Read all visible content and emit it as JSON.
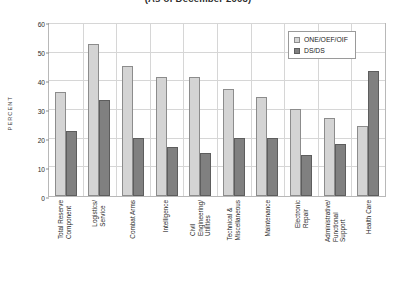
{
  "chart_data": {
    "type": "bar",
    "title": "(As of December 2003)",
    "xlabel": "",
    "ylabel": "PERCENT",
    "ylim": [
      0,
      60
    ],
    "yticks": [
      0,
      10,
      20,
      30,
      40,
      50,
      60
    ],
    "grid": true,
    "legend_position": "top-right",
    "categories": [
      "Total Reserve\nComponent",
      "Logistics/\nService",
      "Combat Arms",
      "Intelligence",
      "Civil\nEngineering/\nUtilities",
      "Technical &\nMiscellaneous",
      "Maintenance",
      "Electronic\nRepair",
      "Administrative/\nFunctional\nSupport",
      "Health Care"
    ],
    "series": [
      {
        "name": "ONE/OEF/OIF",
        "color": "#d4d4d4",
        "values": [
          36,
          52.5,
          45,
          41,
          41,
          37,
          34,
          30,
          27,
          24
        ]
      },
      {
        "name": "DS/DS",
        "color": "#808080",
        "values": [
          22.5,
          33,
          20,
          17,
          15,
          20,
          20,
          14,
          18,
          43
        ]
      }
    ]
  }
}
